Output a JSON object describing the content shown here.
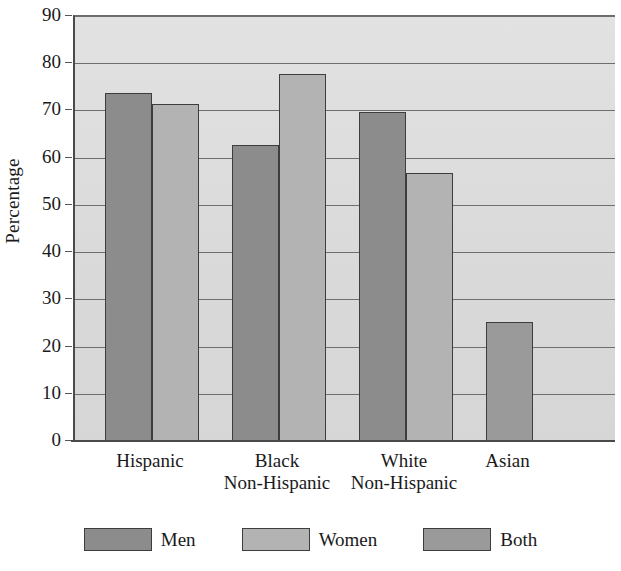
{
  "chart_data": {
    "type": "bar",
    "title": "",
    "subtitle": "",
    "xlabel": "",
    "ylabel": "Percentage",
    "ylim": [
      0,
      90
    ],
    "ytick_step": 10,
    "yticks": [
      90,
      80,
      70,
      60,
      50,
      40,
      30,
      20,
      10,
      0
    ],
    "ytick_labels": [
      "90",
      "80",
      "70",
      "60",
      "50",
      "40",
      "30",
      "20",
      "10",
      "0"
    ],
    "grid": true,
    "grid_axis": "y",
    "legend_position": "bottom",
    "categories": [
      "Hispanic",
      "Black\nNon-Hispanic",
      "White\nNon-Hispanic",
      "Asian"
    ],
    "category_labels": [
      "Hispanic",
      "Black Non-Hispanic",
      "White Non-Hispanic",
      "Asian"
    ],
    "series": [
      {
        "name": "Men",
        "color": "#8c8c8c",
        "values": [
          73.7,
          62.6,
          69.7,
          null
        ]
      },
      {
        "name": "Women",
        "color": "#b3b3b3",
        "values": [
          71.4,
          77.7,
          56.7,
          null
        ]
      },
      {
        "name": "Both",
        "color": "#9a9a9a",
        "values": [
          null,
          null,
          null,
          25.3
        ]
      }
    ],
    "annotations": []
  },
  "legend": {
    "items": [
      {
        "label": "Men",
        "swatch": "men"
      },
      {
        "label": "Women",
        "swatch": "women"
      },
      {
        "label": "Both",
        "swatch": "both"
      }
    ]
  },
  "colors": {
    "men": "#8c8c8c",
    "women": "#b3b3b3",
    "both": "#9a9a9a",
    "plot_background": "#dcdcdc",
    "gridline": "#6e6e6e",
    "axis": "#4a4a4a",
    "text": "#1a1a1a"
  }
}
